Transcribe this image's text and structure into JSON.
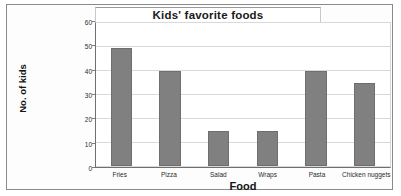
{
  "chart_data": {
    "type": "bar",
    "title": "Kids' favorite foods",
    "xlabel": "Food",
    "ylabel": "No. of kids",
    "categories": [
      "Fries",
      "Pizza",
      "Salad",
      "Wraps",
      "Pasta",
      "Chicken nuggets"
    ],
    "values": [
      50,
      40,
      15,
      15,
      40,
      35
    ],
    "ylim": [
      0,
      60
    ],
    "ytick_labels": [
      "0",
      "10",
      "20",
      "30",
      "40",
      "50",
      "60"
    ],
    "ytick_values": [
      0,
      10,
      20,
      30,
      40,
      50,
      60
    ],
    "grid": true,
    "legend": false,
    "bar_color": "#808080",
    "axis_color": "#6f6f6f",
    "gridline_color": "#d9d9d9"
  }
}
